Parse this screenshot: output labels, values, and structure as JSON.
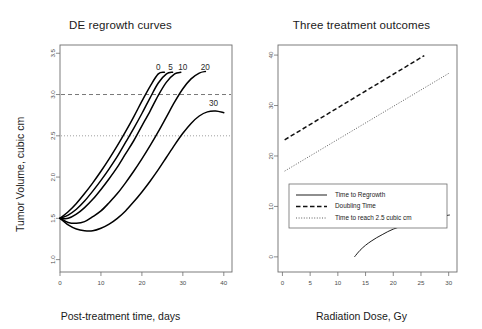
{
  "chart_data": [
    {
      "type": "line",
      "panel": "left",
      "title": "DE regrowth curves",
      "xlabel": "Post-treatment time, days",
      "ylabel": "Tumor Volume, cubic cm",
      "xlim": [
        0,
        42
      ],
      "ylim": [
        0.85,
        3.6
      ],
      "xticks": [
        0,
        10,
        20,
        30,
        40
      ],
      "xtick_labels": [
        "0",
        "10",
        "20",
        "30",
        "40"
      ],
      "yticks": [
        1.0,
        1.5,
        2.0,
        2.5,
        3.0,
        3.5
      ],
      "ytick_labels": [
        "1.0",
        "1.5",
        "2.0",
        "2.5",
        "3.0",
        "3.5"
      ],
      "grid": false,
      "legend": "none",
      "reference_lines": [
        {
          "name": "doubling-volume-line",
          "y": 3.0,
          "style": "dashed"
        },
        {
          "name": "threshold-2p5-line",
          "y": 2.5,
          "style": "dotted"
        }
      ],
      "series": [
        {
          "name": "0",
          "dose_gy": 0,
          "label": "0",
          "label_xy": [
            24.0,
            3.3
          ],
          "points": [
            [
              0,
              1.5
            ],
            [
              2,
              1.58
            ],
            [
              4,
              1.68
            ],
            [
              6,
              1.8
            ],
            [
              8,
              1.93
            ],
            [
              10,
              2.07
            ],
            [
              12,
              2.22
            ],
            [
              14,
              2.38
            ],
            [
              16,
              2.55
            ],
            [
              18,
              2.73
            ],
            [
              20,
              2.92
            ],
            [
              22,
              3.1
            ],
            [
              24,
              3.25
            ],
            [
              25.5,
              3.27
            ]
          ]
        },
        {
          "name": "5",
          "dose_gy": 5,
          "label": "5",
          "label_xy": [
            27.0,
            3.3
          ],
          "points": [
            [
              0,
              1.5
            ],
            [
              2,
              1.54
            ],
            [
              4,
              1.61
            ],
            [
              6,
              1.71
            ],
            [
              8,
              1.83
            ],
            [
              10,
              1.96
            ],
            [
              12,
              2.1
            ],
            [
              14,
              2.25
            ],
            [
              16,
              2.42
            ],
            [
              18,
              2.59
            ],
            [
              20,
              2.77
            ],
            [
              22,
              2.96
            ],
            [
              24,
              3.14
            ],
            [
              26,
              3.25
            ],
            [
              27.5,
              3.27
            ]
          ]
        },
        {
          "name": "10",
          "dose_gy": 10,
          "label": "10",
          "label_xy": [
            30.0,
            3.3
          ],
          "points": [
            [
              0,
              1.5
            ],
            [
              2,
              1.5
            ],
            [
              4,
              1.55
            ],
            [
              6,
              1.63
            ],
            [
              8,
              1.73
            ],
            [
              10,
              1.85
            ],
            [
              12,
              1.98
            ],
            [
              14,
              2.12
            ],
            [
              16,
              2.28
            ],
            [
              18,
              2.44
            ],
            [
              20,
              2.62
            ],
            [
              22,
              2.8
            ],
            [
              24,
              2.99
            ],
            [
              26,
              3.15
            ],
            [
              28,
              3.25
            ],
            [
              29.5,
              3.27
            ]
          ]
        },
        {
          "name": "20",
          "dose_gy": 20,
          "label": "20",
          "label_xy": [
            35.5,
            3.3
          ],
          "points": [
            [
              0,
              1.5
            ],
            [
              2,
              1.45
            ],
            [
              4,
              1.44
            ],
            [
              6,
              1.46
            ],
            [
              8,
              1.52
            ],
            [
              10,
              1.59
            ],
            [
              12,
              1.69
            ],
            [
              14,
              1.8
            ],
            [
              16,
              1.93
            ],
            [
              18,
              2.07
            ],
            [
              20,
              2.22
            ],
            [
              22,
              2.38
            ],
            [
              24,
              2.55
            ],
            [
              26,
              2.73
            ],
            [
              28,
              2.91
            ],
            [
              30,
              3.07
            ],
            [
              32,
              3.19
            ],
            [
              34,
              3.26
            ],
            [
              35.5,
              3.28
            ]
          ]
        },
        {
          "name": "30",
          "dose_gy": 30,
          "label": "30",
          "label_xy": [
            37.5,
            2.86
          ],
          "points": [
            [
              0,
              1.5
            ],
            [
              2,
              1.42
            ],
            [
              4,
              1.37
            ],
            [
              6,
              1.35
            ],
            [
              8,
              1.35
            ],
            [
              10,
              1.38
            ],
            [
              12,
              1.43
            ],
            [
              14,
              1.5
            ],
            [
              16,
              1.59
            ],
            [
              18,
              1.7
            ],
            [
              20,
              1.82
            ],
            [
              22,
              1.95
            ],
            [
              24,
              2.09
            ],
            [
              26,
              2.24
            ],
            [
              28,
              2.39
            ],
            [
              30,
              2.53
            ],
            [
              32,
              2.65
            ],
            [
              34,
              2.74
            ],
            [
              36,
              2.79
            ],
            [
              38,
              2.8
            ],
            [
              40,
              2.78
            ]
          ]
        }
      ]
    },
    {
      "type": "line",
      "panel": "right",
      "title": "Three treatment outcomes",
      "xlabel": "Radiation Dose, Gy",
      "ylabel": "Time, days",
      "xlim": [
        -0.8,
        31.5
      ],
      "ylim": [
        -3.0,
        42.0
      ],
      "xticks": [
        0,
        5,
        10,
        15,
        20,
        25,
        30
      ],
      "xtick_labels": [
        "0",
        "5",
        "10",
        "15",
        "20",
        "25",
        "30"
      ],
      "yticks": [
        0,
        10,
        20,
        30,
        40
      ],
      "ytick_labels": [
        "0",
        "10",
        "20",
        "30",
        "40"
      ],
      "grid": false,
      "legend": "center-left",
      "series": [
        {
          "name": "Time to Regrowth",
          "style": "solid",
          "points": [
            [
              13.0,
              0.0
            ],
            [
              14,
              1.3
            ],
            [
              15,
              2.3
            ],
            [
              16,
              3.1
            ],
            [
              17,
              3.8
            ],
            [
              18,
              4.4
            ],
            [
              19,
              5.0
            ],
            [
              20,
              5.5
            ],
            [
              21,
              5.9
            ],
            [
              22,
              6.3
            ],
            [
              23,
              6.7
            ],
            [
              24,
              7.0
            ],
            [
              25,
              7.3
            ],
            [
              26,
              7.5
            ],
            [
              27,
              7.7
            ],
            [
              28,
              7.9
            ],
            [
              29,
              8.1
            ],
            [
              30.2,
              8.3
            ]
          ]
        },
        {
          "name": "Doubling Time",
          "style": "dashed",
          "points": [
            [
              0.4,
              23.2
            ],
            [
              25.6,
              39.9
            ]
          ]
        },
        {
          "name": "Time to reach 2.5 cubic cm",
          "style": "dotted",
          "points": [
            [
              0.4,
              17.0
            ],
            [
              30.2,
              36.5
            ]
          ]
        }
      ],
      "legend_entries": [
        {
          "label": "Time to Regrowth",
          "style": "solid"
        },
        {
          "label": "Doubling Time",
          "style": "dashed"
        },
        {
          "label": "Time to reach 2.5 cubic cm",
          "style": "dotted"
        }
      ]
    }
  ]
}
